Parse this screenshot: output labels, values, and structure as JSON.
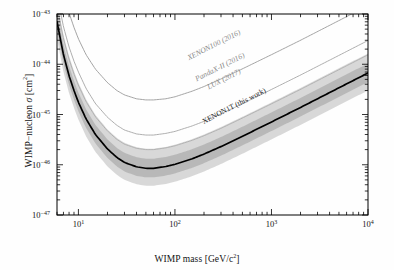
{
  "figure": {
    "name": "wimp-nucleon-cross-section-exclusion-limits",
    "background": "#fefefe"
  },
  "axes": {
    "x": {
      "label": "WIMP mass [GeV/c",
      "label_sup": "2",
      "label_tail": "]",
      "min": 6,
      "max": 10000,
      "scale": "log",
      "ticks": [
        {
          "value": 10,
          "mantissa": "10",
          "exponent": "1"
        },
        {
          "value": 100,
          "mantissa": "10",
          "exponent": "2"
        },
        {
          "value": 1000,
          "mantissa": "10",
          "exponent": "3"
        },
        {
          "value": 10000,
          "mantissa": "10",
          "exponent": "4"
        }
      ]
    },
    "y": {
      "label_pre": "WIMP−nucleon ",
      "label_sym": "σ",
      "label_post": " [cm",
      "label_sup": "2",
      "label_tail": "]",
      "min": 1e-47,
      "max": 1e-43,
      "scale": "log",
      "ticks": [
        {
          "value": 1e-43,
          "mantissa": "10",
          "exponent": "−43"
        },
        {
          "value": 1e-44,
          "mantissa": "10",
          "exponent": "−44"
        },
        {
          "value": 1e-45,
          "mantissa": "10",
          "exponent": "−45"
        },
        {
          "value": 1e-46,
          "mantissa": "10",
          "exponent": "−46"
        },
        {
          "value": 1e-47,
          "mantissa": "10",
          "exponent": "−47"
        }
      ]
    }
  },
  "chart_data": {
    "type": "line",
    "title": "",
    "xlabel": "WIMP mass [GeV/c^2]",
    "ylabel": "WIMP-nucleon sigma [cm^2]",
    "xlim": [
      6,
      10000
    ],
    "ylim": [
      1e-47,
      1e-43
    ],
    "xscale": "log",
    "yscale": "log",
    "grid": false,
    "legend": "inline-curve-labels",
    "series": [
      {
        "name": "XENON100 (2016)",
        "color": "#9a9a9a",
        "width": 0.9,
        "style": "solid",
        "label_x": 260,
        "label_y": 2.2e-44,
        "label_rotation": -27,
        "points": [
          [
            6,
            1e-42
          ],
          [
            7,
            2.6e-43
          ],
          [
            8,
            1.05e-43
          ],
          [
            9,
            5.4e-44
          ],
          [
            10,
            3.2e-44
          ],
          [
            12,
            1.55e-44
          ],
          [
            15,
            8e-45
          ],
          [
            20,
            4.3e-45
          ],
          [
            25,
            3e-45
          ],
          [
            30,
            2.45e-45
          ],
          [
            40,
            2.05e-45
          ],
          [
            50,
            1.95e-45
          ],
          [
            60,
            1.95e-45
          ],
          [
            80,
            2.05e-45
          ],
          [
            100,
            2.25e-45
          ],
          [
            150,
            2.9e-45
          ],
          [
            200,
            3.6e-45
          ],
          [
            300,
            5.1e-45
          ],
          [
            500,
            8.1e-45
          ],
          [
            1000,
            1.55e-44
          ],
          [
            2000,
            3e-44
          ],
          [
            5000,
            7.4e-44
          ],
          [
            10000,
            1.47e-43
          ]
        ]
      },
      {
        "name": "PandaX-II (2016)",
        "color": "#a5a5a5",
        "width": 0.9,
        "style": "solid",
        "label_x": 300,
        "label_y": 8e-45,
        "label_rotation": -27,
        "points": [
          [
            6,
            2.4e-43
          ],
          [
            7,
            5.6e-44
          ],
          [
            8,
            2.2e-44
          ],
          [
            9,
            1.15e-44
          ],
          [
            10,
            7e-45
          ],
          [
            12,
            3.3e-45
          ],
          [
            15,
            1.65e-45
          ],
          [
            20,
            8.8e-46
          ],
          [
            25,
            6.1e-46
          ],
          [
            30,
            4.9e-46
          ],
          [
            40,
            4.1e-46
          ],
          [
            50,
            3.9e-46
          ],
          [
            60,
            3.9e-46
          ],
          [
            80,
            4.2e-46
          ],
          [
            100,
            4.6e-46
          ],
          [
            150,
            5.9e-46
          ],
          [
            200,
            7.3e-46
          ],
          [
            300,
            1.03e-45
          ],
          [
            500,
            1.64e-45
          ],
          [
            1000,
            3.15e-45
          ],
          [
            2000,
            6.1e-45
          ],
          [
            5000,
            1.5e-44
          ],
          [
            10000,
            2.97e-44
          ]
        ]
      },
      {
        "name": "LUX (2017)",
        "color": "#adadad",
        "width": 0.9,
        "style": "solid",
        "label_x": 330,
        "label_y": 4.6e-45,
        "label_rotation": -27,
        "points": [
          [
            6,
            1.4e-43
          ],
          [
            7,
            3.2e-44
          ],
          [
            8,
            1.25e-44
          ],
          [
            9,
            6.4e-45
          ],
          [
            10,
            3.8e-45
          ],
          [
            12,
            1.8e-45
          ],
          [
            15,
            9e-46
          ],
          [
            20,
            4.7e-46
          ],
          [
            25,
            3.2e-46
          ],
          [
            30,
            2.56e-46
          ],
          [
            40,
            2.12e-46
          ],
          [
            50,
            2e-46
          ],
          [
            60,
            2e-46
          ],
          [
            80,
            2.16e-46
          ],
          [
            100,
            2.38e-46
          ],
          [
            150,
            3.05e-46
          ],
          [
            200,
            3.78e-46
          ],
          [
            300,
            5.3e-46
          ],
          [
            500,
            8.5e-46
          ],
          [
            1000,
            1.63e-45
          ],
          [
            2000,
            3.16e-45
          ],
          [
            5000,
            7.8e-45
          ],
          [
            10000,
            1.54e-44
          ]
        ]
      },
      {
        "name": "XENON1T (this work)",
        "color": "#000000",
        "width": 1.7,
        "style": "solid",
        "label_x": 420,
        "label_y": 1.35e-45,
        "label_rotation": -27,
        "points": [
          [
            6,
            7e-44
          ],
          [
            7,
            1.55e-44
          ],
          [
            8,
            5.9e-45
          ],
          [
            9,
            3e-45
          ],
          [
            10,
            1.75e-45
          ],
          [
            12,
            8.2e-46
          ],
          [
            15,
            4e-46
          ],
          [
            20,
            2.06e-46
          ],
          [
            25,
            1.4e-46
          ],
          [
            30,
            1.11e-46
          ],
          [
            40,
            9.1e-47
          ],
          [
            50,
            8.5e-47
          ],
          [
            60,
            8.5e-47
          ],
          [
            80,
            9.2e-47
          ],
          [
            100,
            1.02e-46
          ],
          [
            150,
            1.31e-46
          ],
          [
            200,
            1.63e-46
          ],
          [
            300,
            2.3e-46
          ],
          [
            500,
            3.68e-46
          ],
          [
            1000,
            7.1e-46
          ],
          [
            2000,
            1.38e-45
          ],
          [
            5000,
            3.4e-45
          ],
          [
            10000,
            6.7e-45
          ]
        ]
      }
    ],
    "bands": [
      {
        "name": "XENON1T 1-sigma sensitivity band",
        "color": "#b6b6b6",
        "opacity": 0.95,
        "upper_factor": 1.55,
        "lower_factor": 0.66,
        "of_series": "XENON1T (this work)"
      },
      {
        "name": "XENON1T 2-sigma sensitivity band",
        "color": "#d4d4d4",
        "opacity": 0.9,
        "upper_factor": 2.45,
        "lower_factor": 0.45,
        "of_series": "XENON1T (this work)"
      }
    ]
  },
  "labels": {
    "xenon100": "XENON100 (2016)",
    "pandax": "PandaX-II (2016)",
    "lux": "LUX (2017)",
    "xenon1t": "XENON1T (this work)"
  }
}
